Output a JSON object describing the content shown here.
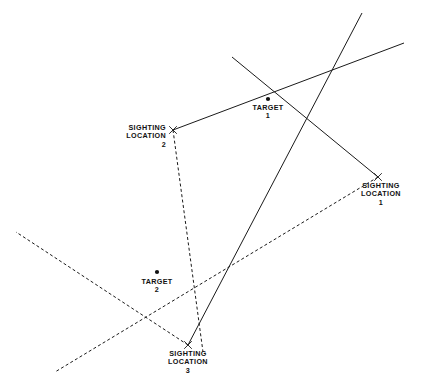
{
  "diagram": {
    "width": 432,
    "height": 384,
    "background_color": "#ffffff",
    "ink_color": "#1a1a1a",
    "labels": {
      "sighting_location_1": "SIGHTING\nLOCATION\n1",
      "sighting_location_2": "SIGHTING\nLOCATION\n2",
      "sighting_location_3": "SIGHTING\nLOCATION\n3",
      "target_1": "TARGET\n1",
      "target_2": "TARGET\n2"
    },
    "markers": [
      {
        "name": "sighting-location-1-marker",
        "glyph": "x",
        "x": 378,
        "y": 177
      },
      {
        "name": "sighting-location-2-marker",
        "glyph": "x",
        "x": 173,
        "y": 130
      },
      {
        "name": "sighting-location-3-marker",
        "glyph": "x",
        "x": 188,
        "y": 345
      },
      {
        "name": "target-1-marker",
        "glyph": "dot",
        "x": 268,
        "y": 99
      },
      {
        "name": "target-2-marker",
        "glyph": "dot",
        "x": 157,
        "y": 272
      }
    ],
    "lines": [
      {
        "name": "bearing-sl2-to-target1",
        "style": "solid",
        "x1": 173,
        "y1": 130,
        "x2": 404,
        "y2": 43
      },
      {
        "name": "bearing-sl1-to-target1",
        "style": "solid",
        "x1": 378,
        "y1": 177,
        "x2": 232,
        "y2": 57
      },
      {
        "name": "bearing-sl3-to-target1",
        "style": "solid",
        "x1": 188,
        "y1": 345,
        "x2": 362,
        "y2": 13
      },
      {
        "name": "bearing-sl2-to-target2",
        "style": "dashed",
        "x1": 173,
        "y1": 130,
        "x2": 203,
        "y2": 352
      },
      {
        "name": "bearing-sl1-to-target2",
        "style": "dashed",
        "x1": 378,
        "y1": 177,
        "x2": 55,
        "y2": 372
      },
      {
        "name": "bearing-sl3-to-target2",
        "style": "dashed",
        "x1": 188,
        "y1": 345,
        "x2": 16,
        "y2": 232
      }
    ]
  }
}
